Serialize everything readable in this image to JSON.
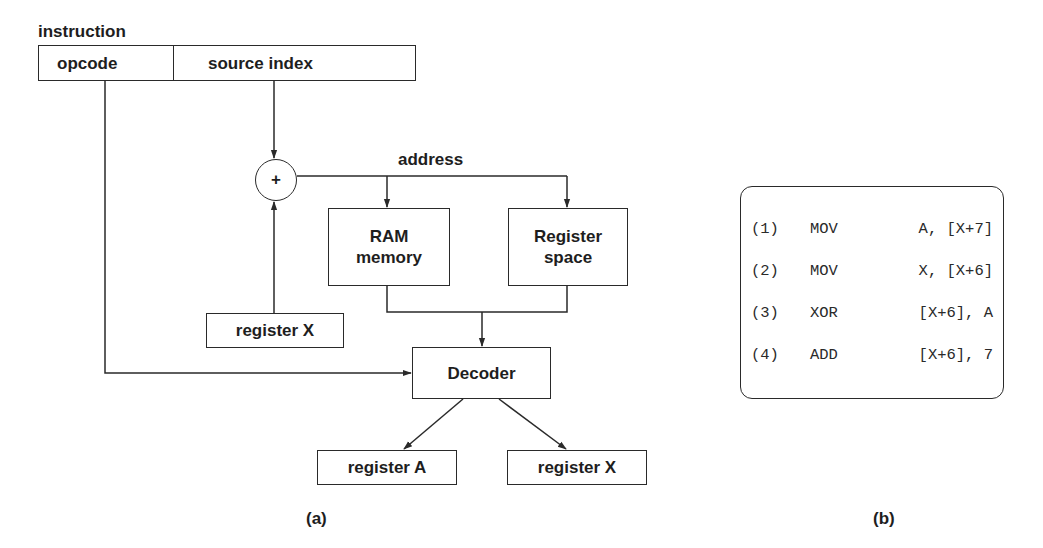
{
  "figure_a": {
    "instruction_label": "instruction",
    "fields": {
      "opcode": "opcode",
      "source_index": "source index"
    },
    "adder_symbol": "+",
    "address_label": "address",
    "ram_memory": "RAM memory",
    "register_space": "Register space",
    "register_x_input": "register X",
    "decoder": "Decoder",
    "register_a_output": "register A",
    "register_x_output": "register X",
    "caption": "(a)"
  },
  "figure_b": {
    "instructions": [
      {
        "num": "(1)",
        "op": "MOV",
        "args": "A, [X+7]"
      },
      {
        "num": "(2)",
        "op": "MOV",
        "args": "X, [X+6]"
      },
      {
        "num": "(3)",
        "op": "XOR",
        "args": "[X+6], A"
      },
      {
        "num": "(4)",
        "op": "ADD",
        "args": "[X+6], 7"
      }
    ],
    "caption": "(b)"
  },
  "colors": {
    "stroke": "#2a2a2a",
    "text": "#1e1e1e",
    "background": "#ffffff"
  }
}
